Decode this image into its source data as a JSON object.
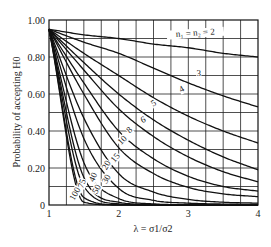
{
  "chart_data": {
    "type": "line",
    "title": "",
    "xlabel": "λ = σ1/σ2",
    "ylabel": "Probability of accepting H0",
    "xlim": [
      1,
      4
    ],
    "ylim": [
      0,
      1
    ],
    "grid": true,
    "x_ticks": [
      1,
      2,
      3,
      4
    ],
    "x_tick_labels": [
      "1",
      "2",
      "3",
      "4"
    ],
    "y_ticks": [
      0,
      0.2,
      0.4,
      0.6,
      0.8,
      1.0
    ],
    "y_tick_labels": [
      "0",
      "0.20",
      "0.40",
      "0.60",
      "0.80",
      "1.00"
    ],
    "x": [
      1,
      1.5,
      2,
      2.5,
      3,
      3.5,
      4
    ],
    "series": [
      {
        "name": "n1 = n2 = 2",
        "label": "n₁ = n₂ = 2",
        "values": [
          0.95,
          0.92,
          0.9,
          0.87,
          0.85,
          0.82,
          0.8
        ]
      },
      {
        "name": "3",
        "label": "3",
        "values": [
          0.95,
          0.88,
          0.82,
          0.74,
          0.66,
          0.59,
          0.53
        ]
      },
      {
        "name": "4",
        "label": "4",
        "values": [
          0.95,
          0.82,
          0.7,
          0.58,
          0.48,
          0.4,
          0.335
        ]
      },
      {
        "name": "5",
        "label": "5",
        "values": [
          0.95,
          0.77,
          0.6,
          0.46,
          0.35,
          0.26,
          0.19
        ]
      },
      {
        "name": "6",
        "label": "6",
        "values": [
          0.95,
          0.73,
          0.52,
          0.37,
          0.26,
          0.18,
          0.125
        ]
      },
      {
        "name": "8",
        "label": "8",
        "values": [
          0.95,
          0.66,
          0.4,
          0.25,
          0.155,
          0.1,
          0.075
        ]
      },
      {
        "name": "10",
        "label": "10",
        "values": [
          0.95,
          0.6,
          0.31,
          0.17,
          0.095,
          0.06,
          0.045
        ]
      },
      {
        "name": "15",
        "label": "15",
        "values": [
          0.95,
          0.47,
          0.17,
          0.07,
          0.03,
          0.015,
          0.01
        ]
      },
      {
        "name": "20",
        "label": "20",
        "values": [
          0.95,
          0.36,
          0.09,
          0.025,
          0.01,
          0.005,
          0.003
        ]
      },
      {
        "name": "30",
        "label": "30",
        "values": [
          0.95,
          0.23,
          0.035,
          0.006,
          0.001,
          0,
          0
        ]
      },
      {
        "name": "40",
        "label": "40",
        "values": [
          0.95,
          0.15,
          0.015,
          0.002,
          0,
          0,
          0
        ]
      },
      {
        "name": "50",
        "label": "50",
        "values": [
          0.95,
          0.1,
          0.006,
          0,
          0,
          0,
          0
        ]
      },
      {
        "name": "75",
        "label": "75",
        "values": [
          0.95,
          0.04,
          0.001,
          0,
          0,
          0,
          0
        ]
      },
      {
        "name": "100",
        "label": "100",
        "values": [
          0.95,
          0.015,
          0,
          0,
          0,
          0,
          0
        ]
      }
    ]
  }
}
